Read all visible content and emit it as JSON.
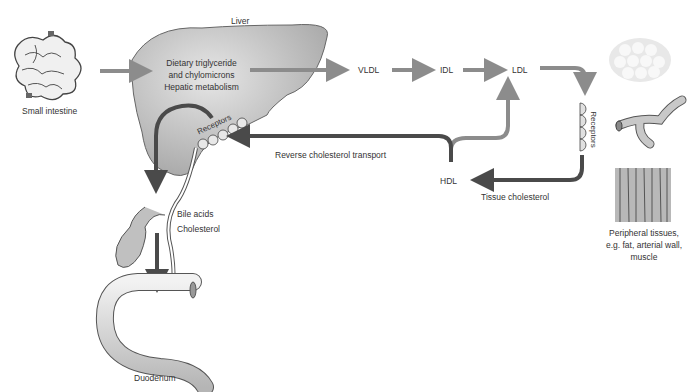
{
  "labels": {
    "liver": "Liver",
    "small_intestine": "Small intestine",
    "dietary_1": "Dietary triglyceride",
    "dietary_2": "and chylomicrons",
    "hepatic": "Hepatic metabolism",
    "receptors_liver": "Receptors",
    "vldl": "VLDL",
    "idl": "IDL",
    "ldl": "LDL",
    "hdl": "HDL",
    "receptors_peripheral": "Receptors",
    "reverse_transport": "Reverse cholesterol transport",
    "tissue_cholesterol": "Tissue cholesterol",
    "bile_acids": "Bile acids",
    "cholesterol": "Cholesterol",
    "duodenum": "Duodenum",
    "peripheral_1": "Peripheral tissues,",
    "peripheral_2": "e.g. fat, arterial wall,",
    "peripheral_3": "muscle"
  },
  "colors": {
    "light_arrow": "#8c8c8c",
    "dark_arrow": "#4a4a4a",
    "organ_fill": "#c8c8c8",
    "text": "#333333"
  }
}
